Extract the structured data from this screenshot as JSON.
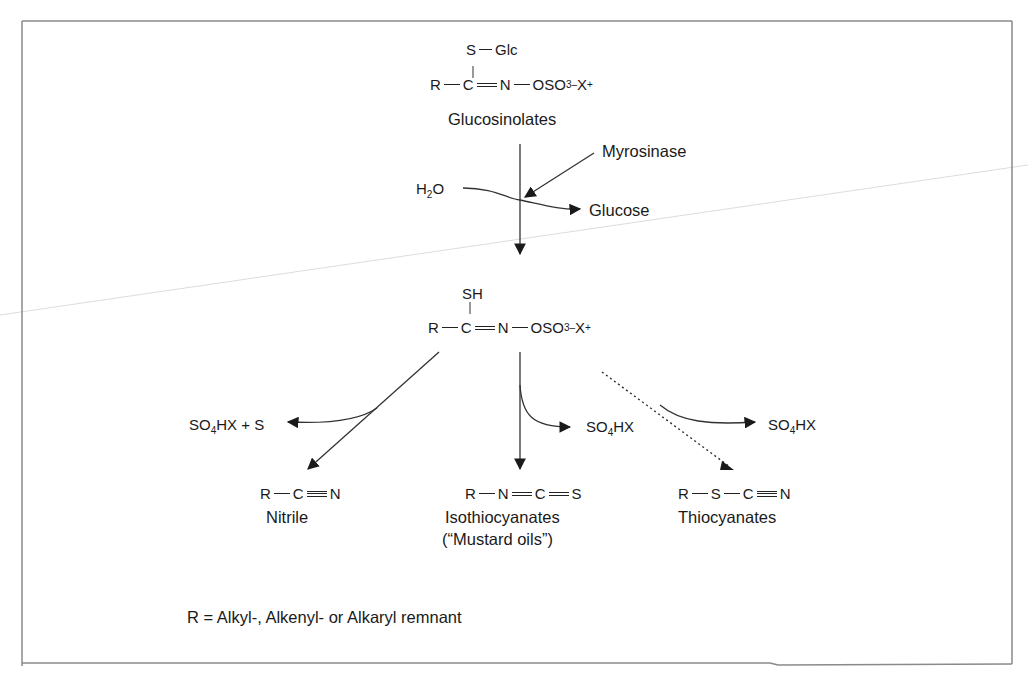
{
  "diagram": {
    "top_structure": {
      "substituent_top": "S",
      "substituent_top_link": "Glc",
      "r": "R",
      "c": "C",
      "n": "N",
      "oso3": "OSO",
      "oso3_sub": "3",
      "charge_minus": "–",
      "x": "X",
      "charge_plus": "+",
      "label": "Glucosinolates"
    },
    "hydrolysis": {
      "enzyme": "Myrosinase",
      "water_h": "H",
      "water_sub": "2",
      "water_o": "O",
      "product_released": "Glucose"
    },
    "intermediate": {
      "substituent_top": "SH",
      "r": "R",
      "c": "C",
      "n": "N",
      "oso3": "OSO",
      "oso3_sub": "3",
      "charge_minus": "–",
      "x": "X",
      "charge_plus": "+"
    },
    "byproducts": {
      "left": "SO4HX + S",
      "left_parts": [
        "SO",
        "4",
        "HX + S"
      ],
      "middle_parts": [
        "SO",
        "4",
        "HX"
      ],
      "right_parts": [
        "SO",
        "4",
        "HX"
      ]
    },
    "products": [
      {
        "formula_atoms": [
          "R",
          "C",
          "N"
        ],
        "bonds": [
          "single",
          "triple"
        ],
        "name": "Nitrile",
        "subname": ""
      },
      {
        "formula_atoms": [
          "R",
          "N",
          "C",
          "S"
        ],
        "bonds": [
          "single",
          "double",
          "double"
        ],
        "name": "Isothiocyanates",
        "subname": "(“Mustard oils”)"
      },
      {
        "formula_atoms": [
          "R",
          "S",
          "C",
          "N"
        ],
        "bonds": [
          "single",
          "single",
          "triple"
        ],
        "name": "Thiocyanates",
        "subname": ""
      }
    ],
    "footnote": "R = Alkyl-, Alkenyl- or Alkaryl remnant",
    "colors": {
      "line": "#333333",
      "frame": "#8a8a8a",
      "stray_line": "#d8d8d8"
    }
  }
}
